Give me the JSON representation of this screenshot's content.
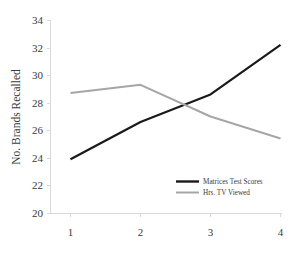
{
  "chart_data": {
    "type": "line",
    "title": "",
    "xlabel": "",
    "ylabel": "No. Brands Recalled",
    "categories": [
      "1",
      "2",
      "3",
      "4"
    ],
    "x": [
      1,
      2,
      3,
      4
    ],
    "ylim": [
      20,
      34
    ],
    "yticks": [
      "20",
      "22",
      "24",
      "26",
      "28",
      "30",
      "32",
      "34"
    ],
    "ytick_values": [
      20,
      22,
      24,
      26,
      28,
      30,
      32,
      34
    ],
    "grid": false,
    "legend_position": "inside-lower-right",
    "series": [
      {
        "name": "Matrices Test Scores",
        "color": "#1a1a1a",
        "width": 2.2,
        "values": [
          23.9,
          26.6,
          28.6,
          32.2
        ]
      },
      {
        "name": "Hrs. TV Viewed",
        "color": "#a6a6a6",
        "width": 2.0,
        "values": [
          28.7,
          29.3,
          27.0,
          25.4
        ]
      }
    ]
  },
  "axis": {
    "y_title": "No. Brands Recalled",
    "axis_color": "#d9d9d9",
    "tick_text_color": "#3a3a3a"
  },
  "legend": {
    "entries": [
      {
        "label": "Matrices Test Scores",
        "color": "#1a1a1a"
      },
      {
        "label": "Hrs. TV Viewed",
        "color": "#a6a6a6"
      }
    ]
  }
}
